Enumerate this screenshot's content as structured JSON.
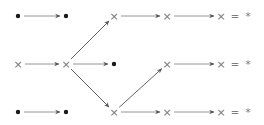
{
  "diagram": {
    "colors": {
      "dot": "#1a1a1a",
      "cross": "#777777",
      "edge": "#8a8a8a",
      "arrowhead": "#555555"
    },
    "symbols": {
      "point": "•",
      "object": "×",
      "equals": "=",
      "terminal": "*"
    },
    "nodes": [
      {
        "id": "t0",
        "row": "top",
        "col": 0,
        "kind": "point"
      },
      {
        "id": "t1",
        "row": "top",
        "col": 1,
        "kind": "point"
      },
      {
        "id": "t2",
        "row": "top",
        "col": 2,
        "kind": "object"
      },
      {
        "id": "t3",
        "row": "top",
        "col": 3,
        "kind": "object"
      },
      {
        "id": "t4",
        "row": "top",
        "col": 4,
        "kind": "object",
        "suffix": "= *"
      },
      {
        "id": "m0",
        "row": "middle",
        "col": 0,
        "kind": "object"
      },
      {
        "id": "m1",
        "row": "middle",
        "col": 1,
        "kind": "object"
      },
      {
        "id": "m2",
        "row": "middle",
        "col": 2,
        "kind": "point"
      },
      {
        "id": "m3",
        "row": "middle",
        "col": 3,
        "kind": "object"
      },
      {
        "id": "m4",
        "row": "middle",
        "col": 4,
        "kind": "object",
        "suffix": "= *"
      },
      {
        "id": "b0",
        "row": "bottom",
        "col": 0,
        "kind": "point"
      },
      {
        "id": "b1",
        "row": "bottom",
        "col": 1,
        "kind": "point"
      },
      {
        "id": "b2",
        "row": "bottom",
        "col": 2,
        "kind": "object"
      },
      {
        "id": "b3",
        "row": "bottom",
        "col": 3,
        "kind": "object"
      },
      {
        "id": "b4",
        "row": "bottom",
        "col": 4,
        "kind": "object",
        "suffix": "= *"
      }
    ],
    "edges": [
      {
        "from": "t0",
        "to": "t1"
      },
      {
        "from": "t2",
        "to": "t3"
      },
      {
        "from": "t3",
        "to": "t4"
      },
      {
        "from": "m0",
        "to": "m1"
      },
      {
        "from": "m1",
        "to": "m2"
      },
      {
        "from": "m3",
        "to": "m4"
      },
      {
        "from": "b0",
        "to": "b1"
      },
      {
        "from": "b2",
        "to": "b3"
      },
      {
        "from": "b3",
        "to": "b4"
      },
      {
        "from": "m1",
        "to": "t2"
      },
      {
        "from": "m1",
        "to": "b2"
      },
      {
        "from": "b2",
        "to": "m3"
      }
    ]
  }
}
